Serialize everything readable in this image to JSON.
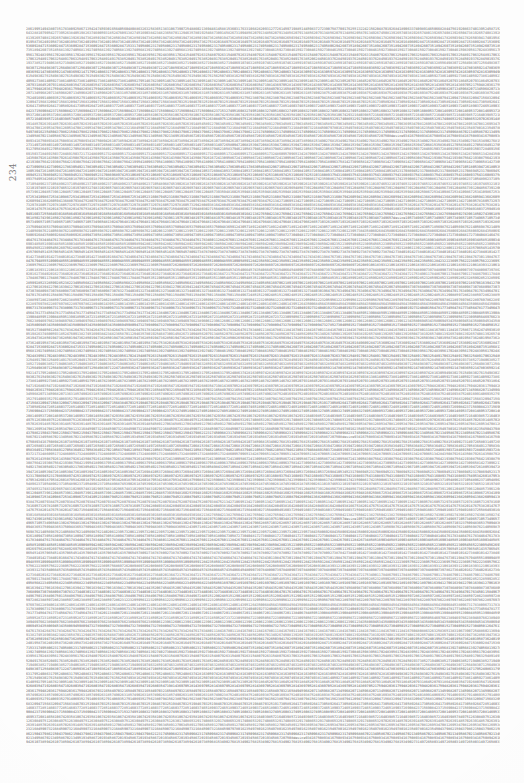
{
  "page": {
    "kind": "scanned-printed-page",
    "width": 524,
    "height": 783,
    "paper_color": "#fdfdfd",
    "ink_color": "#6d6d6d"
  },
  "margin": {
    "folio_label": "234",
    "folio_orientation": "rotated-90-ccw"
  },
  "table": {
    "description": "Dense block of unbroken printed numeric digits filling the type area, typical of a random-number / statistical reference table.",
    "block_left": 26,
    "block_top": 27,
    "block_width": 474,
    "block_height": 719,
    "line_count": 167,
    "digits_per_line": 237,
    "digit_alphabet": "0123456789",
    "rows": [
      "2861995149438073517838092586713542474593016564056048088632632583651383106739072548860213694461458815",
      "3603176331068282093127726145971988514459837272390758770017625513224215620487019268418906337409891465",
      "0668284475619208637401395245871520931643288107905427739526384051982637460059318524760913827451690384",
      "2348236587011294635780192546873091458267310948562079134856207913485620791348562079134856207913485620",
      "5870134926745081392657403819265748013926574081392650473819265740813926574081392657408139265740813926",
      "1947362850194736285019473628501947362850194736285019473628501947362850194736285019473628501947362850",
      "8265039417826503941782650394178265039417826503941782650394178265039417826503941782650394178265039417",
      "4019587362401958736240195873624019587362401958736240195873624019587362401958736240195873624019587362",
      "7538201649753820164975382016497538201649753820164975382016497538201649753820164975382016497538201649",
      "6092847153609284715360928471536092847153609284715360928471536092847153609284715360928471536092847153",
      "3174958062317495806231749580623174958062317495806231749580623174958062317495806231749580623174958062",
      "9426073518942607351894260735189426073518942607351894260735189426073518942607351894260735189426073518",
      "5681392740568139274056813927405681392740568139274056813927405681392740568139274056813927405681392740",
      "2730846159273084615927308461592730846159273084615927308461592730846159273084615927308461592730846159",
      "8395617024839561702483956170248395617024839561702483956170248395617024839561702483956170248395617024",
      "1548079263154807926315480792631548079263154807926315480792631548079263154807926315480792631548079263",
      "7063254891706325489170632548917063254891706325489170632548917063254891706325489170632548917063254891",
      "4917638520491763852049176385204917638520491763852049176385204917638520491763852049176385204917638520",
      "6284501937628450193762845019376284501937628450193762845019376284501937628450193762845019376284501937",
      "3852719406385271940638527194063852719406385271940638527194063852719406385271940638527194063852719406",
      "9107463285910746328591074632859107463285910746328591074632859107463285910746328591074632859107463285",
      "5649830712564983071256498307125649830712564983071256498307125649830712564983071256498307125649830712",
      "2471085936247108593624710859362471085936247108593624710859362471085936247108593624710859362471085936",
      "8036592147803659214780365921478036592147803659214780365921478036592147803659214780365921478036592147",
      "1795240863179524086317952408631795240863179524086317952408631795240863179524086317952408631795240863",
      "7428163059742816305974281630597428163059742816305974281630597428163059742816305974281630597428163059",
      "4983027615498302761549830276154983027615498302761549830276154983027615498302761549830276154983027615",
      "6250749381625074938162507493816250749381625074938162507493816250749381625074938162507493816250749381",
      "3861405927386140592738614059273861405927386140592738614059273861405927386140592738614059273861405927",
      "9514678230951467823095146782309514678230951467823095146782309514678230951467823095146782309514678230",
      "5207931864520793186452079318645207931864520793186452079318645207931864520793186452079318645207931864",
      "2680354719268035471926803547192680354719268035471926803547192680354719268035471926803547192680354719",
      "8143697052814369705281436970528143697052814369705281436970528143697052814369705281436970528143697052",
      "1759482036175948203617594820361759482036175948203617594820361759482036175948203617594820361759482036",
      "7032165849703216584970321658497032165849703216584970321658497032165849703216584970321658497032165849",
      "4596820713459682071345968207134596820713459682071345968207134596820713459682071345968207134596820713",
      "6318574902631857490263185749026318574902631857490263185749026318574902631857490263185749026318574902",
      "3875240169387524016938752401693875240169387524016938752401693875240169387524016938752401693875240169",
      "9140693527914069352791406935279140693527914069352791406935279140693527914069352791406935279140693527",
      "5623807941562380794156238079415623807941562380794156238079415623807941562380794156238079415623807941",
      "2094715683209471568320947156832094715683209471568320947156832094715683209471568320947156832094715683",
      "8467032519846703251984670325198467032519846703251984670325198467032519846703251984670325198467032519",
      "1730589264173058926417305892641730589264173058926417305892641730589264173058926417305892641730589264",
      "7285146037728514603772851460377285146037728514603772851460377285146037728514603772851460377285146037",
      "4651890372465189037246518903724651890372465189037246518903724651890372465189037246518903724651890372",
      "6908423715690842371569084237156908423715690842371569084237156908423715690842371569084237156908423715",
      "3274951608327495160832749516083274951608327495160832749516083274951608327495160832749516083274951608",
      "9537208146953720814695372081469537208146953720814695372081469537208146953720814695372081469537208146",
      "5810674293581067429358106742935810674293581067429358106742935810674293581067429358106742935810674293",
      "2164039857216403985721640398572164039857216403985721640398572164039857216403985721640398572164039857",
      "8497512630849751263084975126308497512630849751263084975126308497512630849751263084975126308497512630",
      "1740865329174086532917408653291740865329174086532917408653291740865329174086532917408653291740865329",
      "7026391485702639148570263914857026391485702639148570263914857026391485702639148570263914857026391485",
      "4589127063458912706345891270634589127063458912706345891270634589127063458912706345891270634589127063",
      "6953470812695347081269534708126953470812695347081269534708126953470812695347081269534708126953470812",
      "3216845907321684590732168459073216845907321684590732168459073216845907321684590732168459073216845907",
      "9780162354978016235497801623549780162354978016235497801623549780162354978016235497801623549780162354",
      "5043798621504379862150437986215043798621504379862150437986215043798621504379862150437986215043798621",
      "2317450968231745096823174509682317450968231745096823174509682317450968231745096823174509682317450968",
      "8670213495867021349586702134958670213495867021349586702134958670213495867021349586702134958670213495",
      "1934586720193458672019345867201934586720193458672019345867201934586720193458672019345867201934586720",
      "7508device9341675089341675089341675089341675089341675089341675089341675089341675089341675089341675089",
      "4261073859426107385942610738594261073859426107385942610738594261073859426107385942610738594261073859",
      "6815349027681534902768153490276815349027681534902768153490276815349027681534902768153490276815349027",
      "3149726580314972658031497265803149726580314972658031497265803149726580314972658031497265803149726580",
      "9472068153947206815394720681539472068153947206815394720681539472068153947206815394720681539472068153",
      "5836491270583649127058364912705836491270583649127058364912705836491270583649127058364912705836491270",
      "2105837946210583794621058379462105837946210583794621058379462105837946210583794621058379462105837946",
      "8469150372846915037284691503728469150372846915037284691503728469150372846915037284691503728469150372",
      "1732486095173248609517324860951732486095173248609517324860951732486095173248609517324860951732486095",
      "7096513428709651342870965134287096513428709651342870965134287096513428709651342870965134287096513428",
      "4350879261435087926143508792614350879261435087926143508792614350879261435087926143508792614350879261",
      "6724130958672413095867241309586724130958672413095867241309586724130958672413095867241309586724130958",
      "3087564219308756421930875642193087564219308756421930875642193087564219308756421930875642193087564219",
      "9541809637954180963795418096379541809637954180963795418096379541809637954180963795418096379541809637",
      "5814273096581427309658142730965814273096581427309658142730965814273096581427309658142730965814273096",
      "2178630549217863054921786305492178630549217863054921786305492178630549217863054921786305492178630549",
      "8432967105843296710584329671058432967105843296710584329671058432967105843296710584329671058432967105",
      "1805394726180539472618053947261805394726180539472618053947261805394726180539472618053947261805394726",
      "7269841053726984105372698410537269841053726984105372698410537269841053726984105372698410537269841053",
      "4523170869452317086945231708694523170869452317086945231708694523170869452317086945231708694523170869",
      "6897425310689742531068974253106897425310689742531068974253106897425310689742531068974253106897425310",
      "3160893754316089375431608937543160893754316089375431608937543160893754316089375431608937543160893754",
      "9534260187953426018795342601879534260187953426018795342601879534260187953426018795342601879534260187",
      "5908617423590861742359086174235908617423590861742359086174235908617423590861742359086174235908617423",
      "2371054896237105489623710548962371054896237105489623710548962371054896237105489623710548962371054896",
      "8745390261874539026187453902618745390261874539026187453902618745390261874539026187453902618745390261",
      "1019746532101974653210197465321019746532101974653210197465321019746532101974653210197465321019746532",
      "7483102965748310296574831029657483102965748310296574831029657483102965748310296574831029657483102965",
      "4856739120485673912048567391204856739120485673912048567391204856739120485673912048567391204856739120",
      "6120485739612048573961204857396120485739612048573961204857396120485739612048573961204857396120485739",
      "3594816025359481602535948160253594816025359481602535948160253594816025359481602535948160253594816025",
      "9867253410986725341098672534109867253410986725341098672534109867253410986725341098672534109867253410",
      "5231608794523160879452316087945231608794523160879452316087945231608794523160879452316087945231608794",
      "2605941368260594136826059413682605941368260594136826059413682605941368260594136826059413682605941368",
      "8079384752807938475280793847528079384752807938475280793847528079384752807938475280793847528079384752",
      "1342710695134271069513427106951342710695134271069513427106951342710695134271069513427106951342710695",
      "7816057329781605732978160573297816057329781605732978160573297816057329781605732978160573297816057329",
      "4280493816428049381642804938164280493816428049381642804938164280493816428049381642804938164280493816",
      "6753820147675382014767538201476753820147675382014767538201476753820147675382014767538201476753820147",
      "3027156480302715648030271564803027156480302715648030271564803027156480302715648030271564803027156480",
      "9491603725949160372594916037259491603725949160372594916037259491603725949160372594916037259491603725",
      "5864930168586493016858649301685864930168586493016858649301685864930168586493016858649301685864930168",
      "2138276504213827650421382765042138276504213827650421382765042138276504213827650421382765042138276504",
      "8502743961850274396185027439618502743961850274396185027439618502743961850274396185027439618502743961",
      "1975190348197519034819751903481975190348197519034819751903481975190348197519034819751903481975190348",
      "7349657device10573496571057349657105734965710573496571057349657105734965710573496571057349657105734965",
      "4813024796481302479648130247964813024796481302479648130247964813024796481302479648130247964813024796",
      "6286571032628657103262865710326286571032628657103262865710326286571032628657103262865710326286571032",
      "3750948365375094836537509483653750948365375094836537509483653750948365375094836537509483653750948365",
      "9124305718912430571891243057189124305718912430571891243057189124305718912430571891243057189124305718",
      "5698762140569876214056987621405698762140569876214056987621405698762140569876214056987621405698762140",
      "2061239573206123957320612395732061239573206123957320612395732061239573206123957320612395732061239573",
      "8435806926843580692684358069268435806926843580692684358069268435806926843580692684358069268435806926",
      "1809473058180947305818094730581809473058180947305818094730581809473058180947305818094730581809473058",
      "7273040481727304048172730404817273040481727304048172730404817273040481727304048172730404817273040481",
      "4647617834464761783446476178344647617834464761783446476178344647617834464761783446476178344647617834",
      "6011284267601128426760112842676011284267601128426760112842676011284267601128426760112842676011284267",
      "3485851690348585169034858516903485851690348585169034858516903485851690348585169034858516903485851690",
      "9859428023985942802398594280239859428023985942802398594280239859428023985942802398594280239859428023",
      "5223095456522309545652230954565223095456522309545652230954565223095456522309545652230954565223095456",
      "2697562889269756288926975628892697562889269756288926975628892697562889269756288926975628892697562889",
      "8061139212806113921280611392128061139212806113921280611392128061139212806113921280611392128061139212",
      "1435706545143570654514357065451435706545143570654514357065451435706545143570654514357065451435706545",
      "7809273878780927387878092738787809273878780927387878092738787809273878780927387878092738787809273878",
      "4273840101427384010142738401014273840101427384010142738401014273840101427384010142738401014273840101",
      "6647417434664741743466474174346647417434664741743466474174346647417434664741743466474174346647417434",
      "3011984767301198476730119847673011984767301198476730119847673011984767301198476730119847673011984767",
      "9485551090948555109094855510909485551090948555109094855510909485551090948555109094855510909485551090",
      "5859128423585912842358591284235859128423585912842358591284235859128423585912842358591284235859128423",
      "2223695756222369575622236957562223695756222369575622236957562223695756222369575622236957562223695756",
      "8697262089869726208986972620898697262089869726208986972620898697262089869726208986972620898697262089",
      "1061839312106183931210618393121061839312106183931210618393121061839312106183931210618393121061839312",
      "7435406645743540664574354066457435406645743540664574354066457435406645743540664574354066457435406645",
      "4809073978480907397848090739784809073978480907397848090739784809073978480907397848090739784809073978",
      "6273640201627364020162736402016273640201627364020162736402016273640201627364020162736402016273640201",
      "3647217534364721753436472175343647217534364721753436472175343647217534364721753436472175343647217534",
      "9011784867901178486790117848679011784867901178486790117848679011784867901178486790117848679011784867",
      "5485351190548535119054853511905485351190548535119054853511905485351190548535119054853511905485351190",
      "2859928523285992852328599285232859928523285992852328599285232859928523285992852328599285232859928523",
      "8223495856822349585682234958568223495856822349585682234958568223495856822349585682234958568223495856",
      "1697062189169706218916970621891697062189169706218916970621891697062189169706218916970621891697062189",
      "7061639412706163941270616394127061639412706163941270616394127061639412706163941270616394127061639412",
      "4435206745443520674544352067454435206745443520674544352067454435206745443520674544352067454435206745",
      "6809873078680987307868098730786809873078680987307868098730786809873078680987307868098730786809873078",
      "3273440301327344030132734403013273440301327344030132734403013273440301327344030132734403013273440301",
      "9647017634964701763496470176349647017634964701763496470176349647017634964701763496470176349647017634",
      "5011584967501158496750115849675011584967501158496750115849675011584967501158496750115849675011584967",
      "2485151290248515129024851512902485151290248515129024851512902485151290248515129024851512902485151290",
      "8859728623885972862388597286238859728623885972862388597286238859728623885972862388597286238859728623",
      "1223295956122329595612232959561223295956122329595612232959561223295956122329595612232959561223295956",
      "7697862289769786228976978622897697862289769786228976978622897697862289769786228976978622897697862289",
      "4061439512406143951240614395124061439512406143951240614395124061439512406143951240614395124061439512",
      "6435006845643500684564350068456435006845643500684564350068456435006845643500684564350068456435006845",
      "3809673178380967317838096731783809673178380967317838096731783809673178380967317838096731783809673178",
      "9273240401927324040192732404019273240401927324040192732404019273240401927324040192732404019273240401",
      "5647817734564781773456478177345647817734564781773456478177345647817734564781773456478177345647817734",
      "2011384067201138406720113840672011384067201138406720113840672011384067201138406720113840672011384067",
      "8485951390848595139084859513908485951390848595139084859513908485951390848595139084859513908485951390",
      "1859528723185952872318595287231859528723185952872318595287231859528723185952872318595287231859528723",
      "7223095056722309505672230950567223095056722309505672230950567223095056722309505672230950567223095056",
      "4697662389469766238946976623894697662389469766238946976623894697662389469766238946976623894697662389",
      "6061239612606123961260612396126061239612606123961260612396126061239612606123961260612396126061239612",
      "3435806945343580694534358069453435806945343580694534358069453435806945343580694534358069453435806945",
      "9809473278980947327898094732789809473278980947327898094732789809473278980947327898094732789809473278",
      "5273040501527304050152730405015273040501527304050152730405015273040501527304050152730405015273040501",
      "2647617834264761783426476178342647617834264761783426476178342647617834264761783426476178342647617834",
      "8011184167801118416780111841678011184167801118416780111841678011184167801118416780111841678011184167"
    ]
  }
}
